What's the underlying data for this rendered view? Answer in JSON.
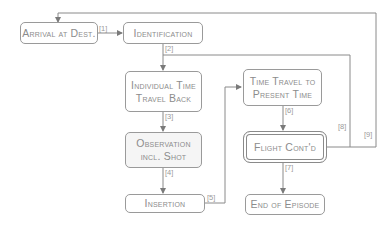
{
  "diagram": {
    "nodes": {
      "arrival": {
        "line1": "Arrival at Dest."
      },
      "identification": {
        "line1": "Identification"
      },
      "individual_time_travel": {
        "line1": "Individual Time",
        "line2": "Travel Back"
      },
      "observation": {
        "line1": "Observation",
        "line2": "incl. Shot"
      },
      "insertion": {
        "line1": "Insertion"
      },
      "time_travel_present": {
        "line1": "Time Travel to",
        "line2": "Present Time"
      },
      "flight_contd": {
        "line1": "Flight Cont'd"
      },
      "end_of_episode": {
        "line1": "End of Episode"
      }
    },
    "edges": {
      "e1": "[1]",
      "e2": "[2]",
      "e3": "[3]",
      "e4": "[4]",
      "e5": "[5]",
      "e6": "[6]",
      "e7": "[7]",
      "e8": "[8]",
      "e9": "[9]"
    },
    "colors": {
      "line": "#8a8a8a",
      "text": "#8c8c8c",
      "shaded_fill": "#f5f5f5"
    }
  }
}
